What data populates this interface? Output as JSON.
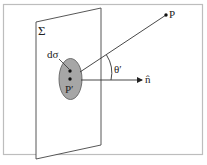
{
  "diagram": {
    "labels": {
      "surface": "Σ",
      "area_element": "dσ",
      "source_point": "P′",
      "field_point": "P",
      "angle": "θ′",
      "normal": "n̂"
    },
    "colors": {
      "frame": "#bdbdbd",
      "line": "#333333",
      "ellipse_fill": "#a6a6a6",
      "background": "#ffffff"
    }
  }
}
